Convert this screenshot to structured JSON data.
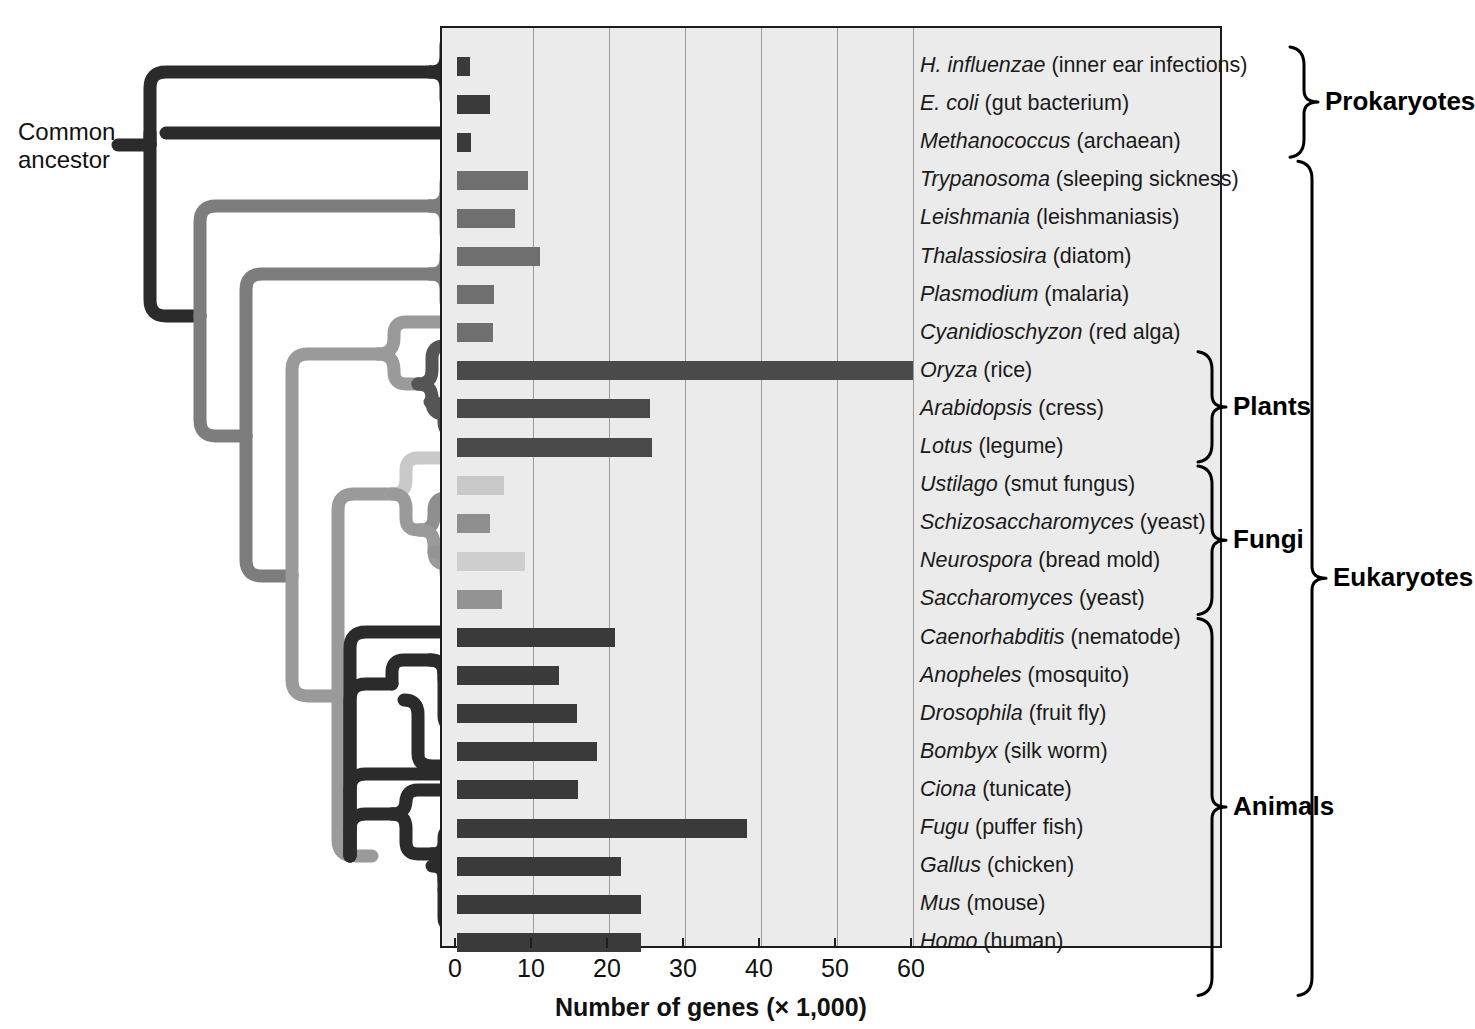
{
  "figure": {
    "common_ancestor_label": "Common\nancestor",
    "x_axis_title": "Number of genes (× 1,000)",
    "x_ticks": [
      "0",
      "10",
      "20",
      "30",
      "40",
      "50",
      "60"
    ],
    "panel_bg": "#ebebeb",
    "gridline_color": "#9a9a9a",
    "axis_color": "#1c1c1c"
  },
  "groups": [
    {
      "name": "prokaryotes",
      "label": "Prokaryotes",
      "first": 0,
      "last": 2
    },
    {
      "name": "eukaryotes",
      "label": "Eukaryotes",
      "first": 3,
      "last": 24
    },
    {
      "name": "plants",
      "label": "Plants",
      "first": 8,
      "last": 10
    },
    {
      "name": "fungi",
      "label": "Fungi",
      "first": 11,
      "last": 14
    },
    {
      "name": "animals",
      "label": "Animals",
      "first": 15,
      "last": 24
    }
  ],
  "chart_data": {
    "type": "bar",
    "title": "",
    "xlabel": "Number of genes (× 1,000)",
    "ylabel": "",
    "xlim": [
      0,
      62
    ],
    "xticks": [
      0,
      10,
      20,
      30,
      40,
      50,
      60
    ],
    "grid": "vertical",
    "legend": "none",
    "orientation": "horizontal",
    "units": "thousands of genes",
    "categories": [
      "H. influenzae",
      "E. coli",
      "Methanococcus",
      "Trypanosoma",
      "Leishmania",
      "Thalassiosira",
      "Plasmodium",
      "Cyanidioschyzon",
      "Oryza",
      "Arabidopsis",
      "Lotus",
      "Ustilago",
      "Schizosaccharomyces",
      "Neurospora",
      "Saccharomyces",
      "Caenorhabditis",
      "Anopheles",
      "Drosophila",
      "Bombyx",
      "Ciona",
      "Fugu",
      "Gallus",
      "Mus",
      "Homo"
    ],
    "values": [
      1.7,
      4.3,
      1.8,
      9.3,
      7.6,
      10.9,
      4.9,
      4.8,
      60.0,
      25.4,
      25.7,
      6.2,
      4.3,
      9.0,
      5.9,
      20.8,
      13.4,
      15.8,
      18.4,
      15.9,
      38.2,
      21.6,
      24.2,
      24.2
    ]
  },
  "rows": [
    {
      "genus": "H. influenzae",
      "common": "(inner ear infections)",
      "value": 1.7,
      "color": "#3a3a3a"
    },
    {
      "genus": "E. coli",
      "common": "(gut bacterium)",
      "value": 4.3,
      "color": "#3a3a3a"
    },
    {
      "genus": "Methanococcus",
      "common": "(archaean)",
      "value": 1.8,
      "color": "#3a3a3a"
    },
    {
      "genus": "Trypanosoma",
      "common": "(sleeping sickness)",
      "value": 9.3,
      "color": "#6f6f6f"
    },
    {
      "genus": "Leishmania",
      "common": "(leishmaniasis)",
      "value": 7.6,
      "color": "#6f6f6f"
    },
    {
      "genus": "Thalassiosira",
      "common": "(diatom)",
      "value": 10.9,
      "color": "#6f6f6f"
    },
    {
      "genus": "Plasmodium",
      "common": "(malaria)",
      "value": 4.9,
      "color": "#6f6f6f"
    },
    {
      "genus": "Cyanidioschyzon",
      "common": "(red alga)",
      "value": 4.8,
      "color": "#6f6f6f"
    },
    {
      "genus": "Oryza",
      "common": "(rice)",
      "value": 60.0,
      "color": "#4a4a4a"
    },
    {
      "genus": "Arabidopsis",
      "common": "(cress)",
      "value": 25.4,
      "color": "#4a4a4a"
    },
    {
      "genus": "Lotus",
      "common": "(legume)",
      "value": 25.7,
      "color": "#4a4a4a"
    },
    {
      "genus": "Ustilago",
      "common": "(smut fungus)",
      "value": 6.2,
      "color": "#c9c9c9"
    },
    {
      "genus": "Schizosaccharomyces",
      "common": "(yeast)",
      "value": 4.3,
      "color": "#8f8f8f"
    },
    {
      "genus": "Neurospora",
      "common": "(bread mold)",
      "value": 9.0,
      "color": "#cfcfcf"
    },
    {
      "genus": "Saccharomyces",
      "common": "(yeast)",
      "value": 5.9,
      "color": "#939393"
    },
    {
      "genus": "Caenorhabditis",
      "common": "(nematode)",
      "value": 20.8,
      "color": "#3a3a3a"
    },
    {
      "genus": "Anopheles",
      "common": "(mosquito)",
      "value": 13.4,
      "color": "#3a3a3a"
    },
    {
      "genus": "Drosophila",
      "common": "(fruit fly)",
      "value": 15.8,
      "color": "#3a3a3a"
    },
    {
      "genus": "Bombyx",
      "common": "(silk worm)",
      "value": 18.4,
      "color": "#3a3a3a"
    },
    {
      "genus": "Ciona",
      "common": "(tunicate)",
      "value": 15.9,
      "color": "#3a3a3a"
    },
    {
      "genus": "Fugu",
      "common": "(puffer fish)",
      "value": 38.2,
      "color": "#3a3a3a"
    },
    {
      "genus": "Gallus",
      "common": "(chicken)",
      "value": 21.6,
      "color": "#3a3a3a"
    },
    {
      "genus": "Mus",
      "common": "(mouse)",
      "value": 24.2,
      "color": "#3a3a3a"
    },
    {
      "genus": "Homo",
      "common": "(human)",
      "value": 24.2,
      "color": "#3a3a3a"
    }
  ]
}
